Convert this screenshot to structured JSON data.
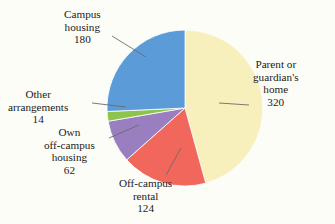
{
  "chart_data": {
    "type": "pie",
    "title": "",
    "total": 700,
    "categories": [
      "Parent or guardian's home",
      "Off-campus rental",
      "Own off-campus housing",
      "Other arrangements",
      "Campus housing"
    ],
    "values": [
      320,
      124,
      62,
      14,
      180
    ],
    "colors": [
      "#f7f0bd",
      "#f1675b",
      "#9a7fc0",
      "#8cc44e",
      "#5b9bd8"
    ],
    "start_angle_deg": 0,
    "direction": "clockwise",
    "legend": "none",
    "grid": false,
    "slices": [
      {
        "name": "parent-home",
        "label_lines": [
          "Parent or",
          "guardian's",
          "home"
        ],
        "value": "320",
        "color": "#f7f0bd",
        "percent": "45.7"
      },
      {
        "name": "offcampus-rental",
        "label_lines": [
          "Off-campus",
          "rental"
        ],
        "value": "124",
        "color": "#f1675b",
        "percent": "17.7"
      },
      {
        "name": "own-offcampus-housing",
        "label_lines": [
          "Own",
          "off-campus",
          "housing"
        ],
        "value": "62",
        "color": "#9a7fc0",
        "percent": "8.9"
      },
      {
        "name": "other-arrangements",
        "label_lines": [
          "Other",
          "arrangements"
        ],
        "value": "14",
        "color": "#8cc44e",
        "percent": "2.0"
      },
      {
        "name": "campus-housing",
        "label_lines": [
          "Campus",
          "housing"
        ],
        "value": "180",
        "color": "#5b9bd8",
        "percent": "25.7"
      }
    ]
  },
  "labels": {
    "campus_housing": {
      "line1": "Campus",
      "line2": "housing",
      "value": "180"
    },
    "parent_home": {
      "line1": "Parent or",
      "line2": "guardian's",
      "line3": "home",
      "value": "320"
    },
    "other_arrangements": {
      "line1": "Other",
      "line2": "arrangements",
      "value": "14"
    },
    "own_offcampus": {
      "line1": "Own",
      "line2": "off-campus",
      "line3": "housing",
      "value": "62"
    },
    "offcampus_rental": {
      "line1": "Off-campus",
      "line2": "rental",
      "value": "124"
    }
  },
  "style": {
    "background": "#fdfdf8",
    "text_color": "#1a1a1a",
    "leader_line_color": "#6b6b6b",
    "slice_edge_color": "#ffffff"
  }
}
